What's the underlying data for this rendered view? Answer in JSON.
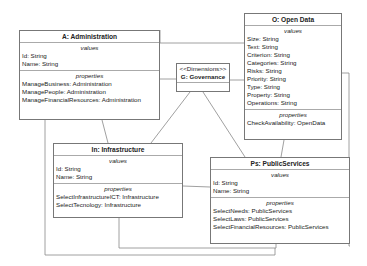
{
  "diagram": {
    "classes": {
      "administration": {
        "title": "A: Administration",
        "values_header": "values",
        "values": [
          "Id: String",
          "Name: String"
        ],
        "properties_header": "properties",
        "properties": [
          "ManageBusiness: Administration",
          "ManagePeople: Administration",
          "ManageFinancialResources: Administration"
        ]
      },
      "open_data": {
        "title": "O: Open Data",
        "values_header": "values",
        "values": [
          "Size: String",
          "Text: String",
          "Criterion: String",
          "Categories: String",
          "Risks: String",
          "Priority: String",
          "Type: String",
          "Property: String",
          "Operations: String"
        ],
        "properties_header": "properties",
        "properties": [
          "CheckAvailability: OpenData"
        ]
      },
      "governance": {
        "stereotype": "<<Dimensions>>",
        "title": "G: Governance"
      },
      "infrastructure": {
        "title": "In: Infrastructure",
        "values_header": "values",
        "values": [
          "Id: String",
          "Name: String"
        ],
        "properties_header": "properties",
        "properties": [
          "SelectInfrastructureICT: Infrastructure",
          "SelectTecnology: Infrastructure"
        ]
      },
      "public_services": {
        "title": "Ps: PublicServices",
        "values_header": "values",
        "values": [
          "Id: String",
          "Name: String"
        ],
        "properties_header": "properties",
        "properties": [
          "SelectNeeds: PublicServices",
          "SelectLaws: PublicServices",
          "SelectFinancialResources: PublicServices"
        ]
      }
    },
    "colors": {
      "line": "#777777",
      "border": "#777777",
      "divider": "#aaaaaa"
    }
  }
}
